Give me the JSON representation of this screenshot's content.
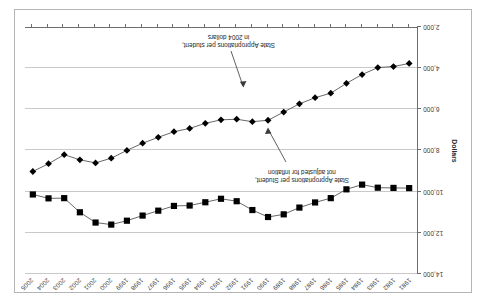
{
  "chart_data": {
    "type": "line",
    "title": "",
    "xlabel": "",
    "ylabel": "Dollars",
    "ylim": [
      2000,
      14000
    ],
    "ytick_labels": [
      "2,000",
      "4,000",
      "6,000",
      "8,000",
      "10,000",
      "12,000",
      "14,000"
    ],
    "ytick_values": [
      2000,
      4000,
      6000,
      8000,
      10000,
      12000,
      14000
    ],
    "grid": true,
    "legend": "none",
    "x": [
      1981,
      1982,
      1983,
      1984,
      1985,
      1986,
      1987,
      1988,
      1989,
      1990,
      1991,
      1992,
      1993,
      1994,
      1995,
      1996,
      1997,
      1998,
      1999,
      2000,
      2001,
      2002,
      2003,
      2004,
      2005
    ],
    "categories": [
      "1981",
      "1982",
      "1983",
      "1984",
      "1985",
      "1986",
      "1987",
      "1988",
      "1989",
      "1990",
      "1991",
      "1992",
      "1993",
      "1994",
      "1995",
      "1996",
      "1997",
      "1998",
      "1999",
      "2000",
      "2001",
      "2002",
      "2003",
      "2004",
      "2005"
    ],
    "series": [
      {
        "name": "State Appropriations per Student, not adjusted for inflation",
        "marker": "diamond",
        "values": [
          3730,
          3880,
          3930,
          4270,
          4700,
          5180,
          5400,
          5700,
          6100,
          6500,
          6570,
          6450,
          6480,
          6650,
          6900,
          7060,
          7330,
          7620,
          7970,
          8350,
          8580,
          8430,
          8180,
          8620,
          9000
        ]
      },
      {
        "name": "State Appropriations per student, in 2004 dollars",
        "marker": "square",
        "values": [
          9810,
          9800,
          9790,
          9640,
          9870,
          10300,
          10510,
          10760,
          11090,
          11220,
          10880,
          10450,
          10330,
          10500,
          10660,
          10680,
          10910,
          11150,
          11400,
          11590,
          11490,
          10990,
          10300,
          10310,
          10120
        ]
      }
    ],
    "annotations": [
      {
        "name": "nominal-series-annotation",
        "line1": "State Appropriations per Student,",
        "line2": "not adjusted for inflation"
      },
      {
        "name": "real-series-annotation",
        "line1": "State Appropriations per student,",
        "line2": "in 2004 dollars"
      }
    ]
  },
  "colors": {
    "series_line": "#565656",
    "marker": "#000000",
    "gridline": "#c9c9c9",
    "axis": "#6d6d6d",
    "frame": "#b5b5b5",
    "text": "#2b2b2b",
    "background": "#ffffff"
  }
}
